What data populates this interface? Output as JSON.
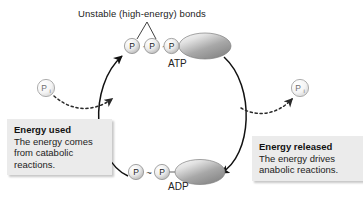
{
  "figure": {
    "type": "cycle-diagram",
    "title_annotation": "Unstable (high-energy) bonds",
    "background_color": "#ffffff"
  },
  "molecules": {
    "top": {
      "name": "ATP",
      "phosphate_count": 3,
      "phosphate_label": "P",
      "bond_symbol": "~",
      "bonds": [
        "~",
        "~"
      ]
    },
    "bottom": {
      "name": "ADP",
      "phosphate_count": 2,
      "phosphate_label": "P",
      "bond_symbol": "~",
      "bonds": [
        "~"
      ]
    }
  },
  "inorganic_phosphate": {
    "left": {
      "letter": "P",
      "subscript": "i"
    },
    "right": {
      "letter": "P",
      "subscript": "i"
    }
  },
  "callouts": {
    "left": {
      "heading": "Energy used",
      "body": "The energy comes from catabolic reactions."
    },
    "right": {
      "heading": "Energy released",
      "body": "The energy drives anabolic reactions."
    }
  },
  "colors": {
    "stroke": "#1a1a1a",
    "callout_fill": "#ebebeb",
    "ellipse_light": "#f6f6f6",
    "ellipse_dark": "#8d8d8d",
    "circle_light": "#fbfbfb",
    "circle_dark": "#b9b9b9",
    "pi_stroke": "#9a9a9a"
  }
}
